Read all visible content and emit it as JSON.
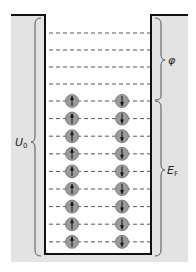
{
  "diagram": {
    "type": "potential-well-energy-levels",
    "colors": {
      "wall_fill": "#e3e3e3",
      "well_fill": "#ffffff",
      "wall_line": "#111111",
      "dash_line": "#555555",
      "electron_fill": "#9a9a9a",
      "electron_stroke": "#6e6e6e",
      "arrow": "#111111",
      "brace": "#555555"
    },
    "labels": {
      "work_function": "φ",
      "well_depth": "U",
      "well_depth_sub": "0",
      "fermi_energy": "E",
      "fermi_energy_sub": "F"
    },
    "empty_levels_count": 4,
    "filled_levels_count": 9,
    "electron_columns": [
      {
        "spin": "up"
      },
      {
        "spin": "down"
      }
    ]
  }
}
